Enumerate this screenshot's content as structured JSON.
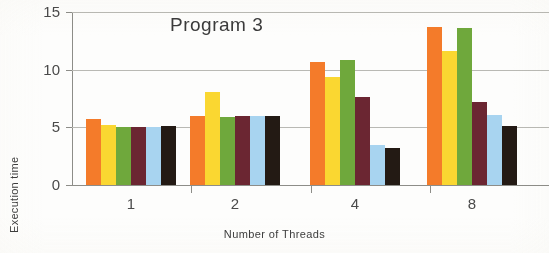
{
  "chart_data": {
    "type": "bar",
    "title": "Program 3",
    "xlabel": "Number of Threads",
    "ylabel": "Execution time",
    "categories": [
      "1",
      "2",
      "4",
      "8"
    ],
    "ylim": [
      0,
      15
    ],
    "yticks": [
      "0",
      "5",
      "10",
      "15"
    ],
    "ytick_values": [
      0,
      5,
      10,
      15
    ],
    "grid": true,
    "legend": "none",
    "series": [
      {
        "name": "series-1",
        "color": "#F47B2A",
        "values": [
          5.7,
          6.0,
          10.7,
          13.7
        ]
      },
      {
        "name": "series-2",
        "color": "#FAD731",
        "values": [
          5.2,
          8.1,
          9.4,
          11.6
        ]
      },
      {
        "name": "series-3",
        "color": "#6FA83C",
        "values": [
          5.0,
          5.9,
          10.8,
          13.6
        ]
      },
      {
        "name": "series-4",
        "color": "#6B2632",
        "values": [
          5.0,
          6.0,
          7.6,
          7.2
        ]
      },
      {
        "name": "series-5",
        "color": "#A8D4F0",
        "values": [
          5.0,
          6.0,
          3.5,
          6.1
        ]
      },
      {
        "name": "series-6",
        "color": "#231A14",
        "values": [
          5.1,
          6.0,
          3.2,
          5.1
        ]
      }
    ]
  }
}
